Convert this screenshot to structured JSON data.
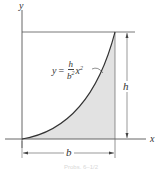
{
  "figure": {
    "axes": {
      "x_label": "x",
      "y_label": "y"
    },
    "curve": {
      "equation_lhs": "y",
      "equation_eq": "=",
      "numerator": "h",
      "denominator_base": "b",
      "denominator_exp": "2",
      "variable": "x",
      "variable_exp": "2"
    },
    "dimensions": {
      "height_label": "h",
      "width_label": "b"
    },
    "colors": {
      "fill": "#e2e2e2",
      "line": "#333333"
    },
    "caption": "Probs. 6–1/2"
  }
}
